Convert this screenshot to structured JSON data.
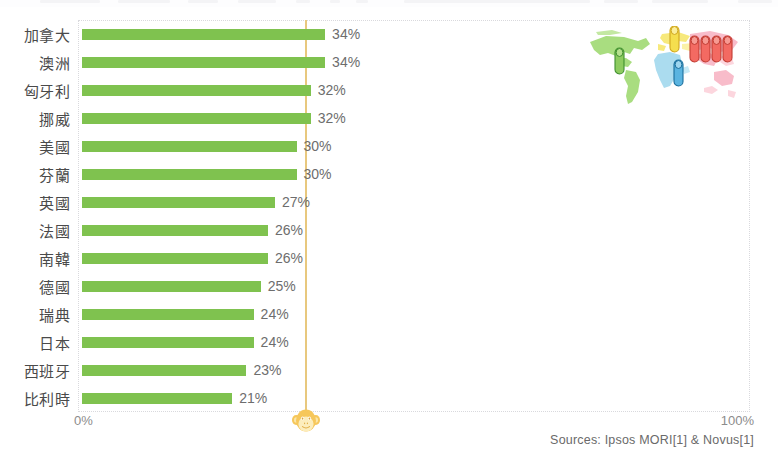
{
  "chart_data": {
    "type": "bar",
    "orientation": "horizontal",
    "title": "",
    "xlabel": "",
    "ylabel": "",
    "xlim": [
      0,
      100
    ],
    "xticks": [
      "0%",
      "100%"
    ],
    "grid": false,
    "bar_color": "#7fc24f",
    "reference_line": {
      "color": "#e8c87e",
      "label": ""
    },
    "categories": [
      "加拿大",
      "澳洲",
      "匈牙利",
      "挪威",
      "美國",
      "芬蘭",
      "英國",
      "法國",
      "南韓",
      "德國",
      "瑞典",
      "日本",
      "西班牙",
      "比利時"
    ],
    "values": [
      34,
      34,
      32,
      32,
      30,
      30,
      27,
      26,
      26,
      25,
      24,
      24,
      23,
      21
    ],
    "value_labels": [
      "34%",
      "34%",
      "32%",
      "32%",
      "30%",
      "30%",
      "27%",
      "26%",
      "26%",
      "25%",
      "24%",
      "24%",
      "23%",
      "21%"
    ],
    "rows": [
      {
        "label": "加拿大",
        "value": 34,
        "value_label": "34%"
      },
      {
        "label": "澳洲",
        "value": 34,
        "value_label": "34%"
      },
      {
        "label": "匈牙利",
        "value": 32,
        "value_label": "32%"
      },
      {
        "label": "挪威",
        "value": 32,
        "value_label": "32%"
      },
      {
        "label": "美國",
        "value": 30,
        "value_label": "30%"
      },
      {
        "label": "芬蘭",
        "value": 30,
        "value_label": "30%"
      },
      {
        "label": "英國",
        "value": 27,
        "value_label": "27%"
      },
      {
        "label": "法國",
        "value": 26,
        "value_label": "26%"
      },
      {
        "label": "南韓",
        "value": 26,
        "value_label": "26%"
      },
      {
        "label": "德國",
        "value": 25,
        "value_label": "25%"
      },
      {
        "label": "瑞典",
        "value": 24,
        "value_label": "24%"
      },
      {
        "label": "日本",
        "value": 24,
        "value_label": "24%"
      },
      {
        "label": "西班牙",
        "value": 23,
        "value_label": "23%"
      },
      {
        "label": "比利時",
        "value": 21,
        "value_label": "21%"
      }
    ]
  },
  "axis": {
    "left_label": "0%",
    "right_label": "100%"
  },
  "footer": {
    "sources": "Sources: Ipsos MORI[1] & Novus[1]"
  },
  "graphic": {
    "name": "world-map-population-pictogram",
    "map_colors": {
      "americas": "#a8dd7f",
      "europe": "#f6e87a",
      "africa": "#a9dcef",
      "asia": "#f7b8c8"
    },
    "figures": [
      {
        "name": "person-green",
        "color": "#8dcb5f",
        "region": "americas"
      },
      {
        "name": "person-yellow",
        "color": "#f5de4e",
        "region": "europe"
      },
      {
        "name": "person-blue",
        "color": "#5ab4e0",
        "region": "africa"
      },
      {
        "name": "person-red-1",
        "color": "#f36a62",
        "region": "asia"
      },
      {
        "name": "person-red-2",
        "color": "#f36a62",
        "region": "asia"
      },
      {
        "name": "person-red-3",
        "color": "#f36a62",
        "region": "asia"
      },
      {
        "name": "person-red-4",
        "color": "#f36a62",
        "region": "asia"
      }
    ]
  },
  "icons": {
    "monkey": "monkey-face-icon"
  }
}
